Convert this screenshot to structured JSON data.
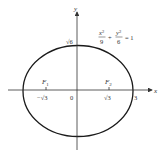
{
  "diagram": {
    "type": "ellipse-graph",
    "equation": {
      "x_term": "x²/9",
      "plus": "+",
      "y_term": "y²/6",
      "equals": "= 1",
      "x_num": "x",
      "x_sup": "2",
      "x_den": "9",
      "y_num": "y",
      "y_sup": "2",
      "y_den": "6",
      "rhs": "= 1"
    },
    "axes": {
      "x_label": "x",
      "y_label": "y",
      "origin_label": "0"
    },
    "ticks": {
      "y_top": "√6",
      "x_left_focus": "−√3",
      "x_right_focus": "√3",
      "x_vertex": "3"
    },
    "foci": [
      {
        "label": "F",
        "sub": "1",
        "x": "−√3"
      },
      {
        "label": "F",
        "sub": "2",
        "x": "√3"
      }
    ],
    "colors": {
      "curve": "#1a1a1a",
      "axis": "#333333",
      "text": "#333333"
    }
  }
}
